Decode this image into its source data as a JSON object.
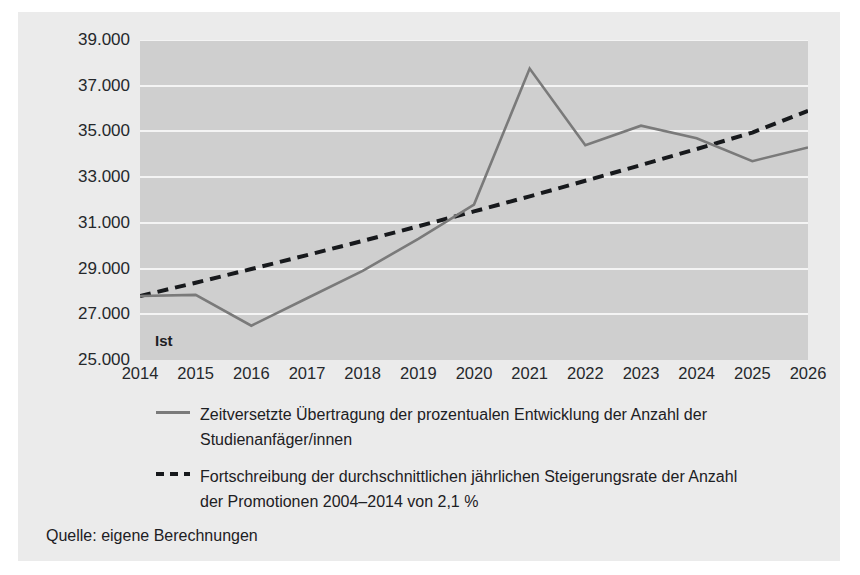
{
  "card": {
    "background": "#ebebeb",
    "plot_background": "#cfcfcf"
  },
  "annotations": {
    "ist_label": "Ist"
  },
  "legend": {
    "items": [
      {
        "style": "solid",
        "color": "#7a7a7a",
        "line1": "Zeitversetzte Übertragung der prozentualen Entwicklung der Anzahl der",
        "line2": "Studienanfäger/innen"
      },
      {
        "style": "dashed",
        "color": "#17191c",
        "line1": "Fortschreibung der durchschnittlichen jährlichen Steigerungsrate der Anzahl",
        "line2": "der Promotionen 2004–2014 von 2,1 %"
      }
    ]
  },
  "source": {
    "text": "Quelle: eigene Berechnungen"
  },
  "chart_data": {
    "type": "line",
    "title": "",
    "subtitle": "",
    "xlabel": "",
    "ylabel": "",
    "grid": true,
    "legend_position": "below",
    "xlim": [
      2014,
      2026
    ],
    "ylim": [
      25000,
      39000
    ],
    "ytick_labels": [
      "39.000",
      "37.000",
      "35.000",
      "33.000",
      "31.000",
      "29.000",
      "27.000",
      "25.000"
    ],
    "ytick_values": [
      39000,
      37000,
      35000,
      33000,
      31000,
      29000,
      27000,
      25000
    ],
    "xtick_labels": [
      "2014",
      "2015",
      "2016",
      "2017",
      "2018",
      "2019",
      "2020",
      "2021",
      "2022",
      "2023",
      "2024",
      "2025",
      "2026"
    ],
    "x": [
      2014,
      2015,
      2016,
      2017,
      2018,
      2019,
      2020,
      2021,
      2022,
      2023,
      2024,
      2025,
      2026
    ],
    "series": [
      {
        "name": "Zeitversetzte Übertragung der prozentualen Entwicklung der Anzahl der Studienanfäger/innen",
        "style": "solid",
        "color": "#7a7a7a",
        "values": [
          27800,
          27850,
          26500,
          27700,
          28900,
          30300,
          31800,
          37750,
          34400,
          35250,
          34700,
          33700,
          34300
        ]
      },
      {
        "name": "Fortschreibung der durchschnittlichen jährlichen Steigerungsrate der Anzahl der Promotionen 2004–2014 von 2,1 %",
        "style": "dashed",
        "color": "#17191c",
        "values": [
          27800,
          28380,
          28980,
          29590,
          30210,
          30850,
          31500,
          32160,
          32840,
          33530,
          34230,
          34950,
          35900
        ]
      }
    ],
    "annotations": [
      {
        "text": "Ist",
        "x": 2014.4,
        "y": 25900
      }
    ]
  }
}
